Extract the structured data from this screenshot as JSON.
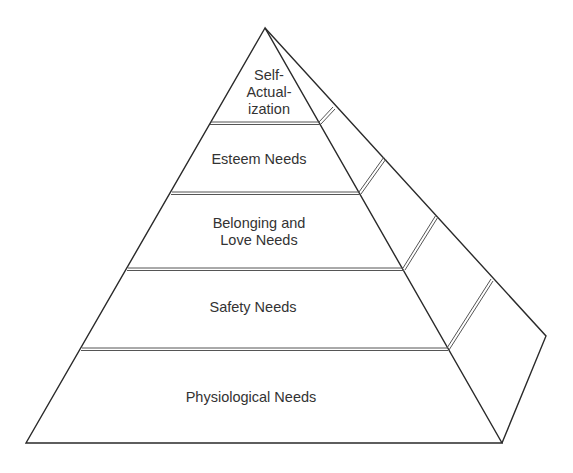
{
  "diagram": {
    "type": "pyramid",
    "title": "",
    "levels": [
      {
        "id": "self-actualization",
        "lines": [
          "Self-",
          "Actual-",
          "ization"
        ]
      },
      {
        "id": "esteem",
        "lines": [
          "Esteem Needs"
        ]
      },
      {
        "id": "belonging",
        "lines": [
          "Belonging and",
          "Love Needs"
        ]
      },
      {
        "id": "safety",
        "lines": [
          "Safety Needs"
        ]
      },
      {
        "id": "physiological",
        "lines": [
          "Physiological Needs"
        ]
      }
    ],
    "colors": {
      "stroke": "#2a2a2a",
      "separator": "#555555",
      "text": "#333333",
      "background": "#ffffff"
    }
  }
}
